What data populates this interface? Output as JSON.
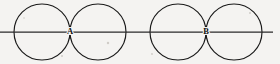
{
  "figure": {
    "background_color": "#f4f3f1",
    "stroke_color": "#1a1a1a",
    "line_color": "#2a2a2a",
    "axis": {
      "name": "horizontal-line",
      "y": 32,
      "x_start": 0,
      "x_end": 273
    },
    "circles": [
      {
        "id": "circle-1",
        "cx": 42,
        "cy": 32,
        "r": 28
      },
      {
        "id": "circle-2",
        "cx": 98,
        "cy": 32,
        "r": 28
      },
      {
        "id": "circle-3",
        "cx": 178,
        "cy": 32,
        "r": 28
      },
      {
        "id": "circle-4",
        "cx": 234,
        "cy": 32,
        "r": 28
      }
    ],
    "labels": [
      {
        "id": "label-a",
        "text": "A",
        "x": 70,
        "y": 32
      },
      {
        "id": "label-b",
        "text": "B",
        "x": 206,
        "y": 32
      }
    ],
    "specks": [
      {
        "cx": 108,
        "cy": 43,
        "r": 1.2
      },
      {
        "cx": 62,
        "cy": 56,
        "r": 1.0
      },
      {
        "cx": 250,
        "cy": 13,
        "r": 1.0
      },
      {
        "cx": 152,
        "cy": 54,
        "r": 0.9
      },
      {
        "cx": 24,
        "cy": 18,
        "r": 0.8
      }
    ]
  }
}
